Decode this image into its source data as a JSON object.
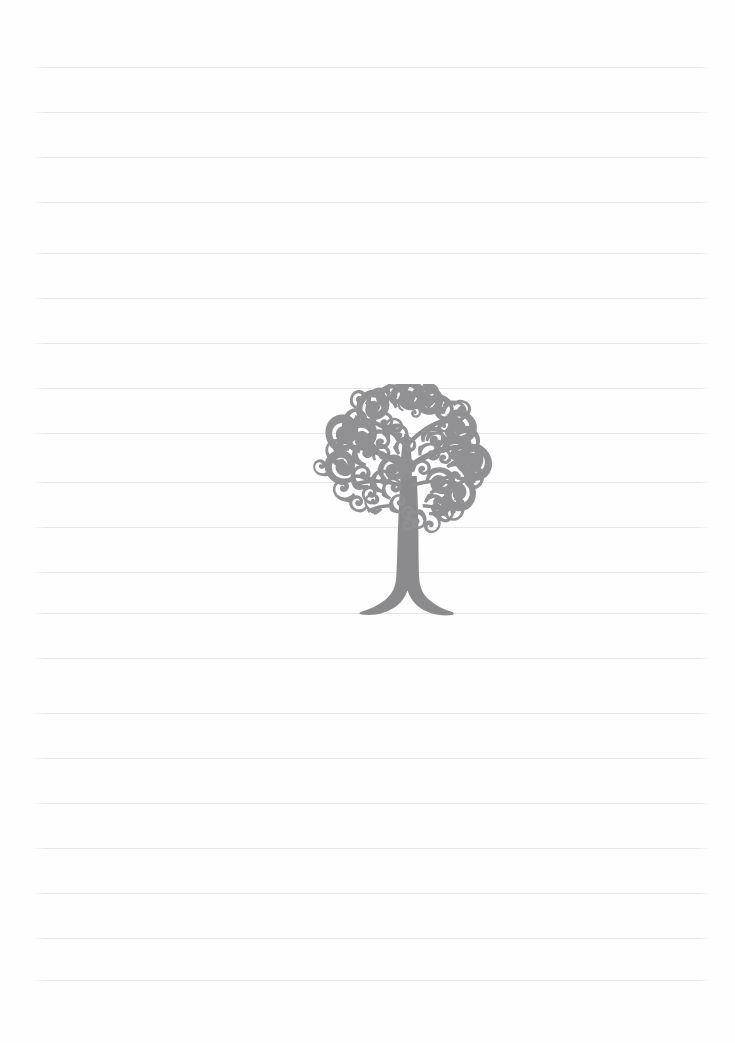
{
  "page": {
    "width": 735,
    "height": 1043,
    "background_color": "#fefefe",
    "orientation": "portrait",
    "content_text": ""
  },
  "ruling": {
    "label": "Ruled guide lines",
    "line_color": "#e8e8ea",
    "line_thickness_px": 1,
    "line_left_x": 32,
    "line_right_x": 710,
    "line_width_px": 678,
    "spacing_px": 45,
    "line_count": 21,
    "line_positions_y": [
      67,
      112,
      157,
      202,
      253,
      298,
      343,
      388,
      433,
      482,
      527,
      572,
      613,
      658,
      713,
      758,
      803,
      848,
      893,
      938,
      980
    ]
  },
  "artwork": {
    "name": "ornamental-tree",
    "label": "Decorative ornamental tree illustration",
    "style": "floral filigree silhouette",
    "fill_color": "#8e8e90",
    "crown_color": "#919193",
    "trunk_color": "#8b8b8d",
    "position": {
      "left": 312,
      "top": 384,
      "width": 192,
      "height": 240
    },
    "crown_bounds": {
      "x_min": 318,
      "x_max": 500,
      "y_min": 390,
      "y_max": 532
    },
    "trunk_bounds": {
      "x_min": 368,
      "x_max": 425,
      "y_min": 470,
      "y_max": 620
    },
    "root_base_y": 620
  },
  "colors": {
    "paper": "#fefefe",
    "rule": "#e8e8ea",
    "ink": "#8e8e90"
  }
}
